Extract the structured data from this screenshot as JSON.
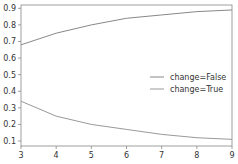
{
  "chart_data": {
    "type": "line",
    "title": "",
    "xlabel": "",
    "ylabel": "",
    "x": [
      3,
      4,
      5,
      6,
      7,
      8,
      9
    ],
    "series": [
      {
        "name": "change=False",
        "values": [
          0.68,
          0.75,
          0.8,
          0.84,
          0.86,
          0.88,
          0.89
        ],
        "color": "#888888"
      },
      {
        "name": "change=True",
        "values": [
          0.34,
          0.25,
          0.2,
          0.17,
          0.14,
          0.12,
          0.11
        ],
        "color": "#999999"
      }
    ],
    "xticks": [
      "3",
      "4",
      "5",
      "6",
      "7",
      "8",
      "9"
    ],
    "yticks": [
      "0.1",
      "0.2",
      "0.3",
      "0.4",
      "0.5",
      "0.6",
      "0.7",
      "0.8",
      "0.9"
    ],
    "xlim": [
      3,
      9
    ],
    "ylim": [
      0.07,
      0.92
    ],
    "grid": false,
    "legend_position": "center right"
  }
}
